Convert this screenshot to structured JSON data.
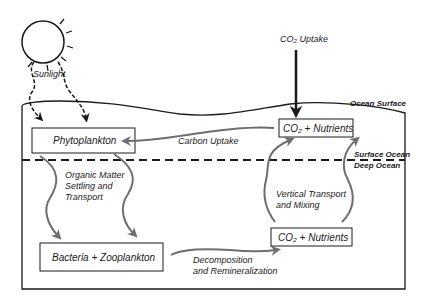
{
  "diagram": {
    "labels": {
      "sunlight": "Sunlight",
      "co2_uptake": "CO₂ Uptake",
      "ocean_surface": "Ocean Surface",
      "surface_ocean": "Surface Ocean",
      "deep_ocean": "Deep Ocean"
    },
    "boxes": {
      "phytoplankton": "Phytoplankton",
      "co2_nutrients_surface": "CO₂ + Nutrients",
      "bacteria_zooplankton": "Bacteria + Zooplankton",
      "co2_nutrients_deep": "CO₂ + Nutrients"
    },
    "flows": {
      "carbon_uptake": "Carbon Uptake",
      "organic_matter": [
        "Organic Matter",
        "Settling and",
        "Transport"
      ],
      "decomposition": [
        "Decomposition",
        "and Remineralization"
      ],
      "vertical_transport": [
        "Vertical Transport",
        "and Mixing"
      ]
    },
    "colors": {
      "outline": "#1a1a1a",
      "flow_arrow": "#6e6e6e",
      "background": "#ffffff"
    }
  }
}
